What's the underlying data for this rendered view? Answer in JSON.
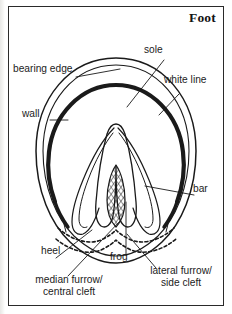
{
  "figure": {
    "title": "Foot",
    "background_color": "#ffffff",
    "ink_color": "#1c1c1c",
    "frame_color": "#2a2a2a"
  },
  "labels": {
    "bearing_edge": "bearing edge",
    "wall": "wall",
    "sole": "sole",
    "white_line": "white line",
    "bar": "bar",
    "heel": "heel",
    "frog": "frog",
    "median_furrow_line1": "median furrow/",
    "median_furrow_line2": "central cleft",
    "lateral_furrow_line1": "lateral furrow/",
    "lateral_furrow_line2": "side cleft"
  },
  "parts": [
    {
      "id": "bearing-edge",
      "label": "bearing edge",
      "side": "left"
    },
    {
      "id": "wall",
      "label": "wall",
      "side": "left"
    },
    {
      "id": "sole",
      "label": "sole",
      "side": "right"
    },
    {
      "id": "white-line",
      "label": "white line",
      "side": "right"
    },
    {
      "id": "bar",
      "label": "bar",
      "side": "right"
    },
    {
      "id": "heel",
      "label": "heel",
      "side": "bottom-left"
    },
    {
      "id": "frog",
      "label": "frog",
      "side": "bottom-center"
    },
    {
      "id": "median-furrow",
      "label": "median furrow/ central cleft",
      "side": "bottom-left"
    },
    {
      "id": "lateral-furrow",
      "label": "lateral furrow/ side cleft",
      "side": "bottom-right"
    }
  ]
}
